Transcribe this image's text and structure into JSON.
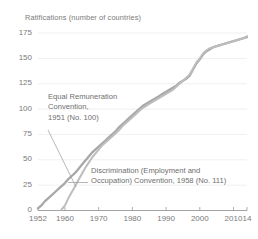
{
  "chart_data": {
    "type": "line",
    "title": "Ratifications (number of countries)",
    "xlabel": "",
    "ylabel": "Ratifications (number of countries)",
    "xlim": [
      1952,
      2014
    ],
    "ylim": [
      0,
      175
    ],
    "grid": true,
    "legend_position": "annotations-inline",
    "y_ticks": [
      0,
      25,
      50,
      75,
      100,
      125,
      150,
      175
    ],
    "y_tick_labels": [
      "0",
      "25",
      "50",
      "75",
      "100",
      "125",
      "150",
      "175"
    ],
    "x_ticks": [
      1952,
      1960,
      1970,
      1980,
      1990,
      2000,
      2010,
      2014
    ],
    "x_tick_labels": [
      "1952",
      "1960",
      "1970",
      "1980",
      "1990",
      "2000",
      "2010",
      "14"
    ],
    "annotations": [
      {
        "name": "equal-remuneration-annotation",
        "lines": [
          "Equal Remuneration",
          "Convention,",
          "1951 (No. 100)"
        ],
        "text": "Equal Remuneration Convention, 1951 (No. 100)"
      },
      {
        "name": "discrimination-annotation",
        "lines": [
          "Discrimination (Employment and",
          "Occupation) Convention, 1958 (No. 111)"
        ],
        "text": "Discrimination (Employment and Occupation) Convention, 1958 (No. 111)"
      }
    ],
    "series": [
      {
        "name": "Equal Remuneration Convention, 1951 (No. 100)",
        "color": "#a8a8a8",
        "x": [
          1952,
          1953,
          1954,
          1955,
          1956,
          1957,
          1958,
          1959,
          1960,
          1961,
          1962,
          1963,
          1964,
          1965,
          1966,
          1967,
          1968,
          1969,
          1970,
          1971,
          1972,
          1973,
          1974,
          1975,
          1976,
          1977,
          1978,
          1979,
          1980,
          1981,
          1982,
          1983,
          1984,
          1985,
          1986,
          1987,
          1988,
          1989,
          1990,
          1991,
          1992,
          1993,
          1994,
          1995,
          1996,
          1997,
          1998,
          1999,
          2000,
          2001,
          2002,
          2003,
          2004,
          2005,
          2006,
          2007,
          2008,
          2009,
          2010,
          2011,
          2012,
          2013,
          2014
        ],
        "values": [
          2,
          5,
          9,
          12,
          15,
          18,
          21,
          24,
          27,
          31,
          34,
          37,
          41,
          45,
          49,
          53,
          57,
          60,
          63,
          66,
          69,
          72,
          75,
          78,
          82,
          85,
          88,
          91,
          94,
          97,
          100,
          103,
          105,
          107,
          109,
          111,
          113,
          115,
          117,
          119,
          121,
          123,
          126,
          128,
          130,
          133,
          139,
          145,
          149,
          154,
          157,
          159,
          161,
          162,
          163,
          164,
          165,
          166,
          167,
          168,
          169,
          170,
          171
        ]
      },
      {
        "name": "Discrimination (Employment and Occupation) Convention, 1958 (No. 111)",
        "color": "#bdbdbd",
        "x": [
          1959,
          1960,
          1961,
          1962,
          1963,
          1964,
          1965,
          1966,
          1967,
          1968,
          1969,
          1970,
          1971,
          1972,
          1973,
          1974,
          1975,
          1976,
          1977,
          1978,
          1979,
          1980,
          1981,
          1982,
          1983,
          1984,
          1985,
          1986,
          1987,
          1988,
          1989,
          1990,
          1991,
          1992,
          1993,
          1994,
          1995,
          1996,
          1997,
          1998,
          1999,
          2000,
          2001,
          2002,
          2003,
          2004,
          2005,
          2006,
          2007,
          2008,
          2009,
          2010,
          2011,
          2012,
          2013,
          2014
        ],
        "values": [
          1,
          5,
          12,
          18,
          24,
          30,
          36,
          42,
          47,
          52,
          56,
          60,
          64,
          67,
          70,
          73,
          76,
          79,
          83,
          86,
          89,
          92,
          95,
          98,
          101,
          103,
          105,
          107,
          109,
          111,
          113,
          115,
          117,
          119,
          122,
          125,
          128,
          131,
          134,
          140,
          146,
          150,
          155,
          158,
          160,
          161,
          162,
          163,
          164,
          165,
          166,
          167,
          168,
          169,
          170,
          172
        ]
      }
    ]
  },
  "axis": {
    "baseline_color": "#9a9a9a",
    "gridline_color": "#ebebeb"
  }
}
